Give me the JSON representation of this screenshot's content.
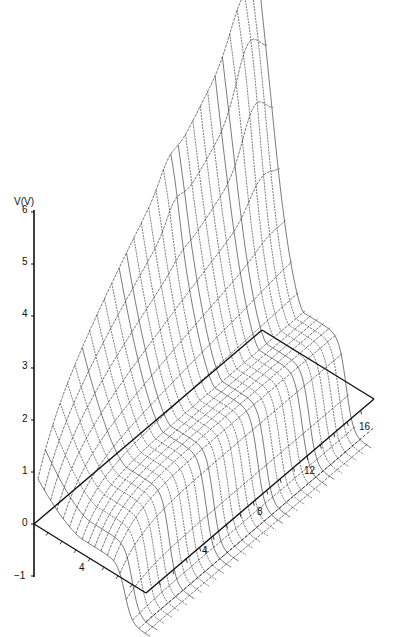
{
  "chart_data": {
    "type": "surface-3d-wireframe",
    "title": "",
    "zlabel": "V(V)",
    "z_ticks": [
      -1,
      0,
      1,
      2,
      3,
      4,
      5,
      6
    ],
    "zlim": [
      -1,
      6
    ],
    "x_axis": {
      "label": "",
      "ticks": [
        4
      ],
      "range": [
        0,
        8
      ]
    },
    "y_axis": {
      "label": "",
      "ticks": [
        4,
        8,
        12,
        16
      ],
      "range": [
        0,
        17
      ]
    },
    "grid": false,
    "line_color": "#222222"
  },
  "axes": {
    "z_label": "V(V)",
    "z_tick_labels": [
      "6",
      "5",
      "4",
      "3",
      "2",
      "1",
      "0",
      "−1"
    ],
    "x_tick_labels": [
      "4"
    ],
    "y_tick_labels": [
      "4",
      "8",
      "12",
      "16"
    ]
  }
}
